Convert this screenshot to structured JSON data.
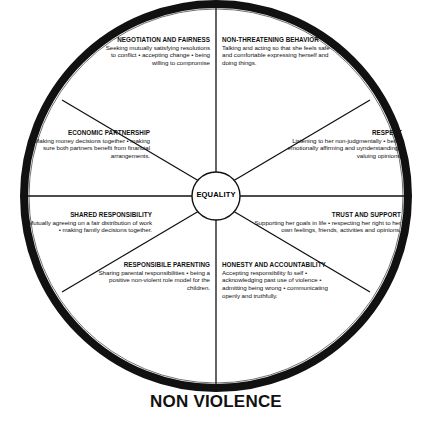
{
  "figure": {
    "caption": "NON VIOLENCE",
    "hub_label": "EQUALITY",
    "colors": {
      "ink": "#000000",
      "background": "#ffffff",
      "ring": "#111111"
    }
  },
  "segments": [
    {
      "id": "negotiation",
      "title": "NEGOTIATION AND FAIRNESS",
      "body": "Seeking mutually satisfying resolutions to conflict • accepting change • being willing to compromise",
      "align": "right"
    },
    {
      "id": "non-threatening",
      "title": "NON-THREATENING BEHAVIOR",
      "body": "Talking and acting so that she feels safe and comfortable expressing herself and doing things.",
      "align": "left"
    },
    {
      "id": "economic",
      "title": "ECONOMIC PARTNERSHIP",
      "body": "Making money decisions together • making sure both partners benefit from financial arrangements.",
      "align": "right"
    },
    {
      "id": "respect",
      "title": "RESPECT",
      "body": "Listening to her non-judgmentally • being emotionally affirming and uynderstanding • valuing opinions.",
      "align": "right"
    },
    {
      "id": "shared-responsibility",
      "title": "SHARED RESPONSIBILITY",
      "body": "Mutually agreeing on a fair distribution of work • making family decisions together.",
      "align": "right"
    },
    {
      "id": "trust-support",
      "title": "TRUST AND SUPPORT",
      "body": "Supporting her goals in life • respecting her right to her own feelings, friends, activities and opinions.",
      "align": "right"
    },
    {
      "id": "responsible-parenting",
      "title": "RESPONSIBILE PARENTING",
      "body": "Sharing parental responsibilities • being a positive non-violent role model for the children.",
      "align": "right"
    },
    {
      "id": "honesty-accountability",
      "title": "HONESTY AND ACCOUNTABILITY",
      "body": "Accepting responsibility fo self • acknowledging past use of violence • admitting being wrong  • communicating openly and truthfully.",
      "align": "left"
    }
  ]
}
